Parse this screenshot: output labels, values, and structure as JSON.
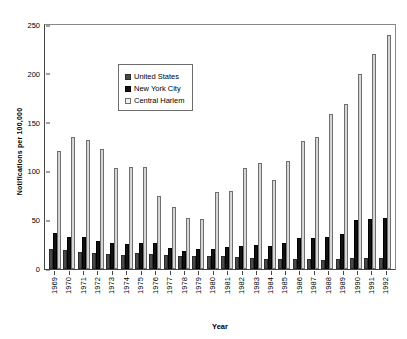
{
  "chart_data": {
    "type": "bar",
    "title": "",
    "xlabel": "Year",
    "ylabel": "Notifications per 100,000",
    "ylim": [
      0,
      250
    ],
    "yticks": [
      0,
      50,
      100,
      150,
      200,
      250
    ],
    "grid": false,
    "legend_position": "top-left-inside",
    "categories": [
      "1969",
      "1970",
      "1971",
      "1972",
      "1973",
      "1974",
      "1975",
      "1976",
      "1977",
      "1978",
      "1979",
      "1980",
      "1981",
      "1982",
      "1983",
      "1984",
      "1985",
      "1986",
      "1987",
      "1988",
      "1989",
      "1990",
      "1991",
      "1992"
    ],
    "series": [
      {
        "name": "United States",
        "color": "#4a4a4a",
        "values": [
          20,
          19,
          17,
          16,
          15,
          14,
          16,
          15,
          14,
          13,
          13,
          13,
          13,
          12,
          11,
          10,
          10,
          10,
          10,
          9,
          10,
          11,
          11,
          11
        ]
      },
      {
        "name": "New York City",
        "color": "#111111",
        "values": [
          37,
          33,
          33,
          29,
          27,
          26,
          27,
          27,
          22,
          18,
          21,
          21,
          23,
          24,
          25,
          24,
          27,
          32,
          32,
          33,
          36,
          50,
          51,
          52
        ]
      },
      {
        "name": "Central Harlem",
        "color": "#e9e9e9",
        "values": [
          121,
          135,
          132,
          123,
          103,
          105,
          105,
          75,
          64,
          52,
          51,
          79,
          80,
          104,
          109,
          91,
          111,
          131,
          135,
          159,
          169,
          200,
          220,
          240
        ]
      }
    ]
  },
  "legend": {
    "items": [
      {
        "label": "United States",
        "swatch": "us-swatch"
      },
      {
        "label": "New York City",
        "swatch": "nyc-swatch"
      },
      {
        "label": "Central Harlem",
        "swatch": "central-harlem-swatch"
      }
    ]
  }
}
